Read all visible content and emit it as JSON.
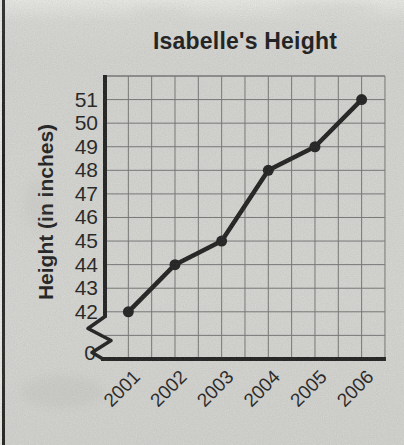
{
  "page": {
    "paper_color": "#d9d9d6",
    "ink_color": "#1b1b1b",
    "grid_color": "#6a6a6a",
    "edge_line_color": "#1c1c1a"
  },
  "chart_data": {
    "type": "line",
    "title": "Isabelle's Height",
    "ylabel": "Height (in inches)",
    "xlabel": "",
    "categories": [
      "2001",
      "2002",
      "2003",
      "2004",
      "2005",
      "2006"
    ],
    "values": [
      42,
      44,
      45,
      48,
      49,
      51
    ],
    "y_ticks_top_to_bottom": [
      "51",
      "50",
      "49",
      "48",
      "47",
      "46",
      "45",
      "44",
      "43",
      "42"
    ],
    "y_origin_label": "0",
    "axis_break": true,
    "ylim": [
      42,
      51
    ],
    "grid": true,
    "x_tick_rotation_deg": -45,
    "legend": "none",
    "marker": "circle",
    "line_color": "#1b1b1b",
    "grid_color": "#6a6a6a"
  }
}
